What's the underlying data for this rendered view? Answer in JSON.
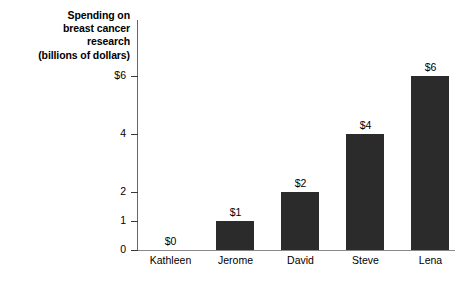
{
  "chart_data": {
    "type": "bar",
    "title": "Spending on breast cancer research (billions of dollars)",
    "title_lines": [
      "Spending on",
      "breast cancer",
      "research",
      "(billions of dollars)"
    ],
    "xlabel": "",
    "ylabel": "Spending on breast cancer research (billions of dollars)",
    "categories": [
      "Kathleen",
      "Jerome",
      "David",
      "Steve",
      "Lena"
    ],
    "values": [
      0,
      1,
      2,
      4,
      6
    ],
    "data_labels": [
      "$0",
      "$1",
      "$2",
      "$4",
      "$6"
    ],
    "ylim": [
      0,
      6.9
    ],
    "y_ticks": [
      0,
      1,
      2,
      4,
      6
    ],
    "y_tick_labels": [
      "0",
      "1",
      "2",
      "4",
      "$6"
    ],
    "grid": false,
    "legend": null,
    "bar_color": "#2b2b2b",
    "axis_color": "#666666",
    "background": "#ffffff"
  }
}
